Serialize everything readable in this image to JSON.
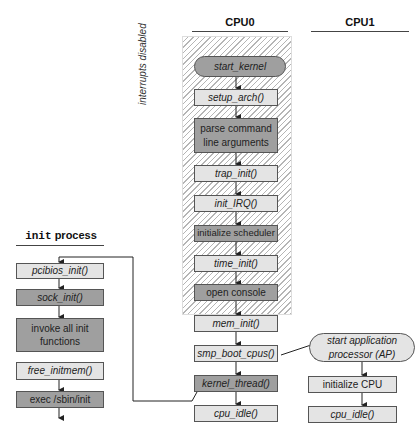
{
  "headers": {
    "cpu0": "CPU0",
    "cpu1": "CPU1",
    "init_process_mono": "init",
    "init_process_rest": " process"
  },
  "region_label": "interrupts disabled",
  "cpu0_steps": [
    {
      "label": "start_kernel",
      "style": "dark",
      "italic": true,
      "shape": "pill"
    },
    {
      "label": "setup_arch()",
      "style": "light",
      "italic": true
    },
    {
      "label": "parse command line arguments",
      "style": "dark",
      "italic": false
    },
    {
      "label": "trap_init()",
      "style": "light",
      "italic": true
    },
    {
      "label": "init_IRQ()",
      "style": "light",
      "italic": true
    },
    {
      "label": "initialize scheduler",
      "style": "dark",
      "italic": false
    },
    {
      "label": "time_init()",
      "style": "light",
      "italic": true
    },
    {
      "label": "open console",
      "style": "dark",
      "italic": false
    },
    {
      "label": "mem_init()",
      "style": "light",
      "italic": true
    },
    {
      "label": "smp_boot_cpus()",
      "style": "light",
      "italic": true
    },
    {
      "label": "kernel_thread()",
      "style": "dark",
      "italic": true
    },
    {
      "label": "cpu_idle()",
      "style": "light",
      "italic": true
    }
  ],
  "cpu1_steps": [
    {
      "label": "start application processor (AP)",
      "style": "light",
      "italic": true,
      "shape": "pill"
    },
    {
      "label": "initialize CPU",
      "style": "light",
      "italic": false
    },
    {
      "label": "cpu_idle()",
      "style": "light",
      "italic": true
    }
  ],
  "init_steps": [
    {
      "label": "pcibios_init()",
      "style": "light",
      "italic": true
    },
    {
      "label": "sock_init()",
      "style": "dark",
      "italic": true
    },
    {
      "label": "invoke all init functions",
      "style": "dark",
      "italic": false
    },
    {
      "label": "free_initmem()",
      "style": "light",
      "italic": true
    },
    {
      "label": "exec /sbin/init",
      "style": "dark",
      "italic": false
    }
  ]
}
